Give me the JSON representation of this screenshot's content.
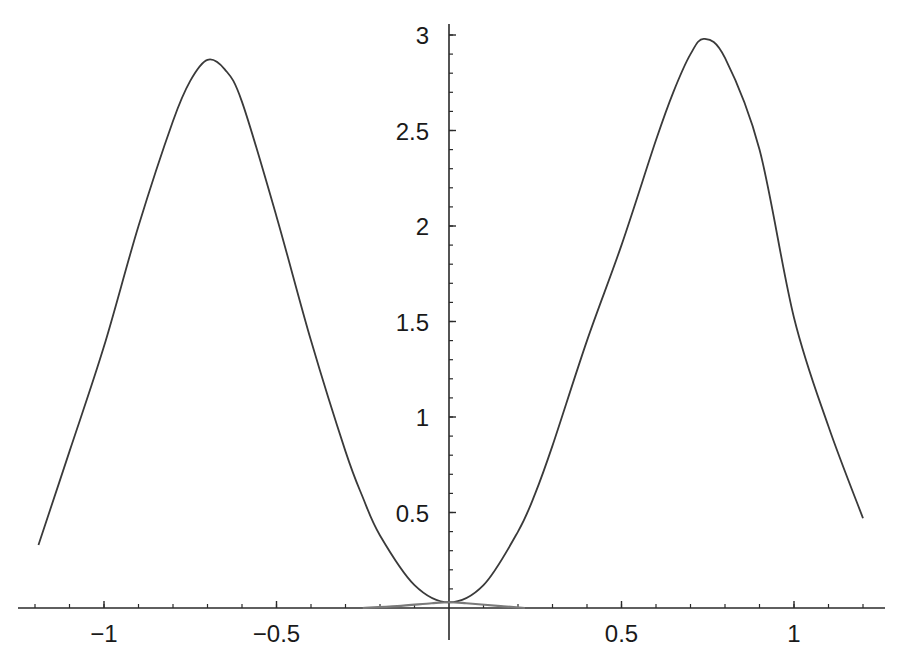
{
  "chart_data": {
    "type": "line",
    "title": "",
    "xlabel": "",
    "ylabel": "",
    "xlim": [
      -1.2,
      1.24
    ],
    "ylim": [
      0,
      3.05
    ],
    "grid": false,
    "legend": null,
    "x_ticks": [
      -1,
      -0.5,
      0.5,
      1
    ],
    "x_tick_labels": [
      "−1",
      "−0.5",
      "0.5",
      "1"
    ],
    "y_ticks": [
      0.5,
      1,
      1.5,
      2,
      2.5,
      3
    ],
    "y_tick_labels": [
      "0.5",
      "1",
      "1.5",
      "2",
      "2.5",
      "3"
    ],
    "x_minor_step": 0.1,
    "y_minor_step": 0.1,
    "axes_origin": [
      0,
      0
    ],
    "series": [
      {
        "name": "main curve",
        "color": "#3a3a3a",
        "x": [
          -1.19,
          -1.1,
          -1.0,
          -0.9,
          -0.8,
          -0.75,
          -0.7,
          -0.65,
          -0.6,
          -0.5,
          -0.4,
          -0.3,
          -0.25,
          -0.2,
          -0.1,
          0.0,
          0.1,
          0.2,
          0.25,
          0.3,
          0.4,
          0.5,
          0.6,
          0.65,
          0.7,
          0.74,
          0.8,
          0.9,
          1.0,
          1.1,
          1.2
        ],
        "y": [
          0.33,
          0.82,
          1.37,
          2.0,
          2.55,
          2.76,
          2.87,
          2.82,
          2.65,
          2.05,
          1.4,
          0.82,
          0.58,
          0.38,
          0.12,
          0.03,
          0.12,
          0.4,
          0.6,
          0.85,
          1.4,
          1.9,
          2.45,
          2.7,
          2.9,
          2.98,
          2.88,
          2.4,
          1.52,
          0.95,
          0.47
        ]
      },
      {
        "name": "small bump near origin",
        "color": "#7a7a7a",
        "x": [
          -0.25,
          -0.15,
          -0.05,
          0.0,
          0.05,
          0.15,
          0.22
        ],
        "y": [
          0.0,
          0.01,
          0.025,
          0.03,
          0.025,
          0.01,
          0.0
        ]
      }
    ]
  }
}
